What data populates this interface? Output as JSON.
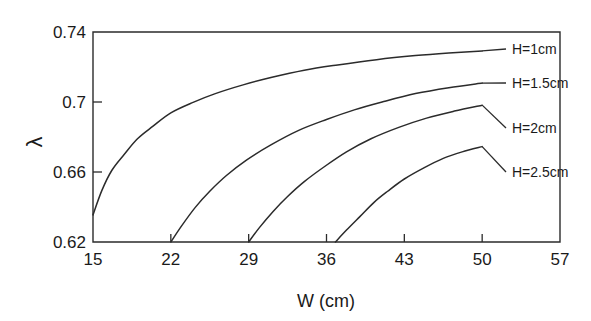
{
  "chart_data": {
    "type": "line",
    "title": "",
    "xlabel": "W (cm)",
    "ylabel": "λ",
    "xlim": [
      15,
      57
    ],
    "ylim": [
      0.62,
      0.74
    ],
    "xticks": [
      "15",
      "22",
      "29",
      "36",
      "43",
      "50",
      "57"
    ],
    "xtick_values": [
      15,
      22,
      29,
      36,
      43,
      50,
      57
    ],
    "yticks": [
      "0.62",
      "0.66",
      "0.7",
      "0.74"
    ],
    "ytick_values": [
      0.62,
      0.66,
      0.7,
      0.74
    ],
    "grid": false,
    "legend_position": "inline-right-labels",
    "line_color": "#2b2b2b",
    "background_color": "#ffffff",
    "series": [
      {
        "name": "H=1cm",
        "label": "H=1cm",
        "x": [
          15.0,
          15.8,
          16.7,
          17.8,
          19.0,
          20.4,
          22.0,
          24.0,
          26.0,
          28.5,
          31.0,
          34.0,
          37.0,
          40.5,
          44.0,
          47.0,
          50.0
        ],
        "values": [
          0.6355,
          0.6495,
          0.661,
          0.67,
          0.679,
          0.6862,
          0.6938,
          0.6998,
          0.7048,
          0.7098,
          0.714,
          0.7182,
          0.7212,
          0.7242,
          0.7265,
          0.728,
          0.7292
        ]
      },
      {
        "name": "H=1.5cm",
        "label": "H=1.5cm",
        "x": [
          22.0,
          23.0,
          24.2,
          25.5,
          27.0,
          28.8,
          31.0,
          33.5,
          36.0,
          38.5,
          41.0,
          44.0,
          47.0,
          50.0
        ],
        "values": [
          0.62,
          0.6295,
          0.6398,
          0.649,
          0.658,
          0.6668,
          0.6755,
          0.6838,
          0.69,
          0.6955,
          0.7,
          0.7048,
          0.7082,
          0.7108
        ]
      },
      {
        "name": "H=2cm",
        "label": "H=2cm",
        "x": [
          29.0,
          30.0,
          31.2,
          32.5,
          34.0,
          35.8,
          37.8,
          40.0,
          42.5,
          45.0,
          47.5,
          50.0
        ],
        "values": [
          0.62,
          0.6285,
          0.6375,
          0.646,
          0.6545,
          0.663,
          0.6715,
          0.679,
          0.6855,
          0.6908,
          0.6948,
          0.6982
        ]
      },
      {
        "name": "H=2.5cm",
        "label": "H=2.5cm",
        "x": [
          36.8,
          37.8,
          39.0,
          40.3,
          41.5,
          43.0,
          44.8,
          46.5,
          48.2,
          50.0
        ],
        "values": [
          0.62,
          0.6268,
          0.6345,
          0.6428,
          0.649,
          0.656,
          0.6625,
          0.6678,
          0.6715,
          0.6745
        ]
      }
    ]
  },
  "labels": {
    "series_label_x": [
      512,
      512,
      512,
      512
    ]
  }
}
